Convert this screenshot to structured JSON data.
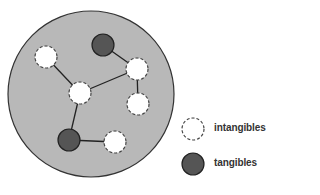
{
  "diagram": {
    "container": {
      "cx": 91,
      "cy": 94,
      "r": 83,
      "fill": "#b8b8b8",
      "stroke": "#333333"
    },
    "nodes": [
      {
        "id": "t1",
        "type": "tangible",
        "cx": 103,
        "cy": 45,
        "r": 11
      },
      {
        "id": "i1",
        "type": "intangible",
        "cx": 46,
        "cy": 57,
        "r": 11
      },
      {
        "id": "i2",
        "type": "intangible",
        "cx": 137,
        "cy": 69,
        "r": 11
      },
      {
        "id": "i3",
        "type": "intangible",
        "cx": 80,
        "cy": 93,
        "r": 11
      },
      {
        "id": "i4",
        "type": "intangible",
        "cx": 138,
        "cy": 104,
        "r": 11
      },
      {
        "id": "t2",
        "type": "tangible",
        "cx": 69,
        "cy": 140,
        "r": 11
      },
      {
        "id": "i5",
        "type": "intangible",
        "cx": 115,
        "cy": 142,
        "r": 11
      }
    ],
    "edges": [
      [
        "t1",
        "i2"
      ],
      [
        "i1",
        "i3"
      ],
      [
        "i3",
        "i2"
      ],
      [
        "i2",
        "i4"
      ],
      [
        "i3",
        "t2"
      ],
      [
        "t2",
        "i5"
      ]
    ],
    "colors": {
      "tangible_fill": "#555555",
      "intangible_fill": "#ffffff",
      "stroke": "#333333"
    }
  },
  "legend": {
    "items": [
      {
        "type": "intangible",
        "label": "intangibles"
      },
      {
        "type": "tangible",
        "label": "tangibles"
      }
    ]
  }
}
